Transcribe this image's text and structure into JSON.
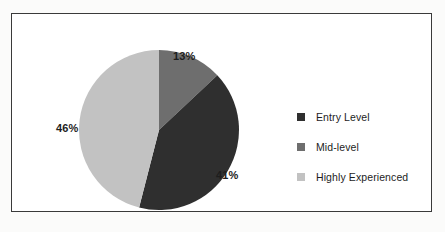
{
  "chart_data": {
    "type": "pie",
    "title": "",
    "categories": [
      "Entry Level",
      "Mid-level",
      "Highly Experienced"
    ],
    "values": [
      41,
      13,
      46
    ],
    "value_unit": "%",
    "data_labels": [
      "41%",
      "13%",
      "46%"
    ],
    "colors": [
      "#2f2f2f",
      "#6e6e6e",
      "#c2c2c2"
    ],
    "start_angle_deg": 0,
    "direction": "clockwise",
    "slice_order_from_top_clockwise": [
      "Mid-level",
      "Entry Level",
      "Highly Experienced"
    ],
    "legend": {
      "position": "right",
      "entries": [
        {
          "label": "Entry Level",
          "color": "#2f2f2f",
          "value": 41,
          "data_label": "41%"
        },
        {
          "label": "Mid-level",
          "color": "#6e6e6e",
          "value": 13,
          "data_label": "13%"
        },
        {
          "label": "Highly Experienced",
          "color": "#c2c2c2",
          "value": 46,
          "data_label": "46%"
        }
      ]
    },
    "grid": false,
    "xlabel": "",
    "ylabel": ""
  },
  "frame": {
    "border_color": "#3a3a3a",
    "background": "#ffffff"
  },
  "labels": {
    "mid": "13%",
    "entry": "41%",
    "high": "46%"
  }
}
